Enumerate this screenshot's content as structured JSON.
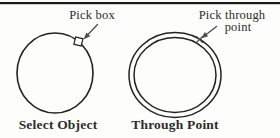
{
  "figure": {
    "left": {
      "callout_label": "Pick box",
      "caption": "Select Object",
      "marker": "square-outline"
    },
    "right": {
      "callout_label_line1": "Pick through",
      "callout_label_line2": "point",
      "caption": "Through Point",
      "marker": "x-cross"
    },
    "colors": {
      "background": "#fdfdfb",
      "top_rule": "#1a1a1a",
      "line": "#222222",
      "arrow": "#4d4d4d",
      "text": "#2e2c2a"
    }
  }
}
